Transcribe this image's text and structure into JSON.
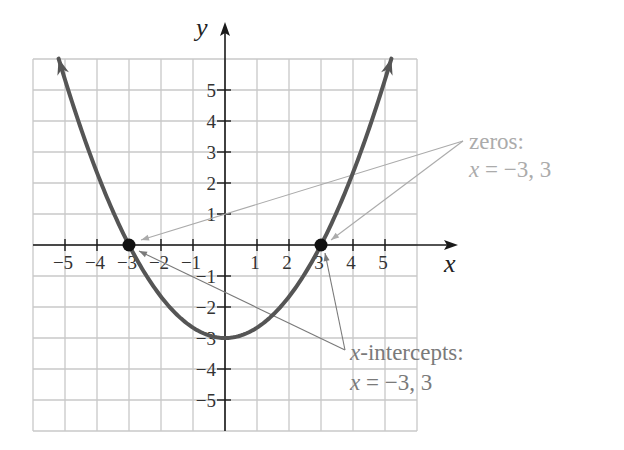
{
  "chart_data": {
    "type": "line",
    "title": "",
    "function": "y = x^2/3 - 3",
    "xlabel": "x",
    "ylabel": "y",
    "xlim": [
      -6,
      6
    ],
    "ylim": [
      -6,
      6
    ],
    "grid": true,
    "x_ticks": [
      -5,
      -4,
      -3,
      -2,
      -1,
      1,
      2,
      3,
      4,
      5
    ],
    "x_tick_labels": [
      "−5",
      "−4",
      "−3",
      "−2",
      "−1",
      "1",
      "2",
      "3",
      "4",
      "5"
    ],
    "y_ticks": [
      5,
      4,
      3,
      2,
      1,
      -1,
      -2,
      -3,
      -4,
      -5
    ],
    "y_tick_labels": [
      "5",
      "4",
      "3",
      "2",
      "1",
      "−1",
      "−2",
      "−3",
      "−4",
      "−5"
    ],
    "series": [
      {
        "name": "parabola",
        "x_range": [
          -5.2,
          5.2
        ],
        "color": "#555555"
      }
    ],
    "points": [
      {
        "x": -3,
        "y": 0
      },
      {
        "x": 3,
        "y": 0
      }
    ],
    "annotations": [
      {
        "id": "zeros",
        "lines": [
          "zeros:",
          "x = −3, 3"
        ],
        "targets": [
          {
            "x": -3,
            "y": 0
          },
          {
            "x": 3,
            "y": 0
          }
        ],
        "position": "right-upper",
        "color": "#ababab"
      },
      {
        "id": "x-intercepts",
        "lines": [
          "x-intercepts:",
          "x = −3, 3"
        ],
        "targets": [
          {
            "x": -3,
            "y": 0
          },
          {
            "x": 3,
            "y": 0
          }
        ],
        "position": "right-lower",
        "color": "#7a7a7a"
      }
    ]
  },
  "labels": {
    "x_axis": "x",
    "y_axis": "y",
    "zeros_title": "zeros:",
    "zeros_eq_var": "x",
    "zeros_eq_rest": " = −3, 3",
    "intercepts_title_var": "x",
    "intercepts_title_rest": "-intercepts:",
    "intercepts_eq_var": "x",
    "intercepts_eq_rest": " = −3, 3"
  }
}
